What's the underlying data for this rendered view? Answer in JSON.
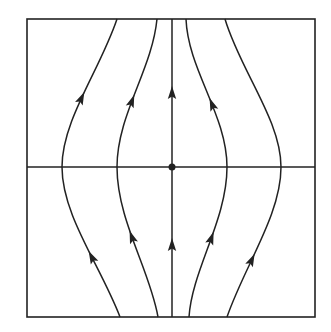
{
  "diagram": {
    "type": "phase-portrait",
    "colors": {
      "stroke": "#222222",
      "background": "#ffffff"
    },
    "frame": {
      "x": 27,
      "y": 19,
      "width": 288,
      "height": 298
    },
    "axes": {
      "horizontal_y": 167,
      "vertical_x": 172
    },
    "fixed_point": {
      "x": 172,
      "y": 167,
      "r": 3.5
    },
    "streamlines": [
      {
        "name": "outer-left",
        "path": "M120,317 C100,265 62,215 62,167 C62,120 100,70 117,19",
        "arrows": [
          [
            82,
            263,
            -65
          ],
          [
            82,
            240,
            -65
          ]
        ]
      },
      {
        "name": "inner-left",
        "path": "M158,317 C150,270 117,220 117,167 C117,115 152,70 157,19",
        "arrows": [
          [
            140,
            235,
            -70
          ],
          [
            137,
            105,
            -70
          ]
        ]
      },
      {
        "name": "center",
        "path": "M172,317 L172,19",
        "arrows": [
          [
            172,
            245,
            -90
          ],
          [
            172,
            92,
            -90
          ]
        ]
      },
      {
        "name": "inner-right",
        "path": "M189,317 C192,270 227,220 227,167 C227,115 188,70 186,19",
        "arrows": [
          [
            203,
            236,
            -110
          ],
          [
            206,
            107,
            -110
          ]
        ]
      },
      {
        "name": "outer-right",
        "path": "M227,317 C245,265 281,215 281,167 C281,120 240,70 225,19",
        "arrows": [
          [
            253,
            262,
            -115
          ],
          [
            253,
            262,
            -115
          ]
        ]
      }
    ],
    "arrowheads_visible": [
      {
        "x": 82,
        "y": 263
      },
      {
        "x": 80,
        "y": 98
      },
      {
        "x": 141,
        "y": 235
      },
      {
        "x": 137,
        "y": 104
      },
      {
        "x": 172,
        "y": 245
      },
      {
        "x": 172,
        "y": 92
      },
      {
        "x": 203,
        "y": 236
      },
      {
        "x": 206,
        "y": 107
      },
      {
        "x": 253,
        "y": 261
      }
    ]
  }
}
